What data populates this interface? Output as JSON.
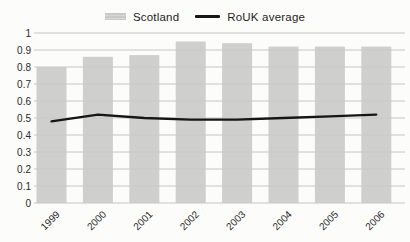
{
  "legend": {
    "position": "top",
    "items": [
      {
        "label": "Scotland",
        "swatch": "bar",
        "color": "#c8c8c6"
      },
      {
        "label": "RoUK average",
        "swatch": "line",
        "color": "#161616"
      }
    ]
  },
  "axes": {
    "y": {
      "min": 0,
      "max": 1,
      "tick_labels": [
        "0",
        "0.1",
        "0.2",
        "0.3",
        "0.4",
        "0.5",
        "0.6",
        "0.7",
        "0.8",
        "0.9",
        "1"
      ]
    },
    "x": {
      "labels": [
        "1999",
        "2000",
        "2001",
        "2002",
        "2003",
        "2004",
        "2005",
        "2006"
      ],
      "rotation_deg": -45
    }
  },
  "chart_data": {
    "type": "bar",
    "categories": [
      "1999",
      "2000",
      "2001",
      "2002",
      "2003",
      "2004",
      "2005",
      "2006"
    ],
    "series": [
      {
        "name": "Scotland",
        "type": "bar",
        "color": "#c8c8c6",
        "values": [
          0.8,
          0.86,
          0.87,
          0.95,
          0.94,
          0.92,
          0.92,
          0.92
        ]
      },
      {
        "name": "RoUK average",
        "type": "line",
        "color": "#161616",
        "values": [
          0.48,
          0.52,
          0.5,
          0.49,
          0.49,
          0.5,
          0.51,
          0.52
        ]
      }
    ],
    "title": "",
    "xlabel": "",
    "ylabel": "",
    "ylim": [
      0,
      1
    ],
    "grid": true,
    "legend_position": "top"
  },
  "colors": {
    "background": "#fcfcfa",
    "gridline": "#bfbfbd",
    "tick_text": "#2a2a2a",
    "bar_fill": "#c8c8c6",
    "line_stroke": "#161616"
  }
}
